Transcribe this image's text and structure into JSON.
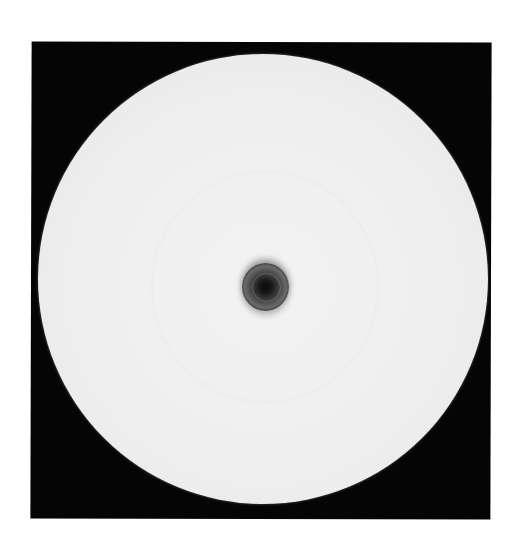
{
  "image": {
    "subject": "culture dish with central disk and surrounding clear zone",
    "colors": {
      "background": "#ffffff",
      "frame": "#050505",
      "dish": "#eeeeee",
      "zone": "#f2f2f2",
      "disk": "#1a1a1a"
    }
  }
}
